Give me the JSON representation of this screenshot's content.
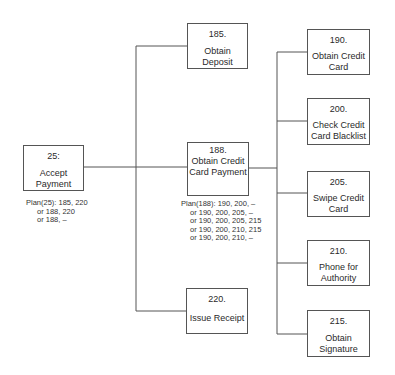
{
  "diagram": {
    "root": {
      "id": "25:",
      "label": "Accept Payment"
    },
    "root_plan": [
      "Plan(25): 185, 220",
      "or 188, 220",
      "or 188, –"
    ],
    "level1": [
      {
        "id": "185.",
        "label": "Obtain Deposit"
      },
      {
        "id": "188.",
        "label": "Obtain Credit Card Payment"
      },
      {
        "id": "220.",
        "label": "Issue Receipt"
      }
    ],
    "level1_plan": [
      "Plan(188): 190, 200, –",
      "or 190, 200, 205, –",
      "or 190, 200, 205, 215",
      "or 190, 200, 210, 215",
      "or 190, 200, 210, –"
    ],
    "level2": [
      {
        "id": "190.",
        "label": "Obtain Credit Card"
      },
      {
        "id": "200.",
        "label": "Check Credit Card Blacklist"
      },
      {
        "id": "205.",
        "label": "Swipe Credit Card"
      },
      {
        "id": "210.",
        "label": "Phone for Authority"
      },
      {
        "id": "215.",
        "label": "Obtain Signature"
      }
    ]
  }
}
